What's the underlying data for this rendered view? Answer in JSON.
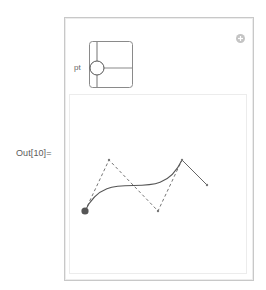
{
  "cell": {
    "out_label": "Out[10]="
  },
  "manipulate": {
    "add_button_icon": "plus-circle-icon",
    "control": {
      "label": "pt",
      "type": "locator-pane",
      "locator_position": {
        "x": 8,
        "y": 27
      }
    }
  },
  "plot": {
    "colors": {
      "curve": "#555555",
      "polygon_dashed": "#666666",
      "segment": "#555555",
      "start_point": "#555555",
      "points": "#777777"
    },
    "control_points": [
      {
        "x": 15,
        "y": 116
      },
      {
        "x": 39,
        "y": 65
      },
      {
        "x": 88,
        "y": 116
      },
      {
        "x": 112,
        "y": 65
      },
      {
        "x": 137,
        "y": 90
      }
    ],
    "start_point_index": 0
  }
}
